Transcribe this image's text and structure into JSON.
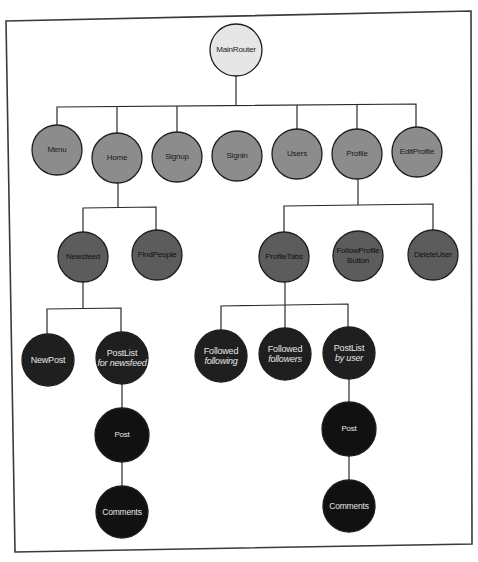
{
  "diagram": {
    "colors": {
      "level0": "#e6e6e6",
      "level1": "#8c8c8c",
      "level2": "#5c5c5c",
      "level3": "#1f1f1f",
      "stroke": "#2a2a2a",
      "frame": "#3a3a3a"
    },
    "nodes": {
      "main_router": {
        "label": "MainRouter"
      },
      "menu": {
        "label": "Menu"
      },
      "home": {
        "label": "Home"
      },
      "signup": {
        "label": "Signup"
      },
      "signin": {
        "label": "Signin"
      },
      "users": {
        "label": "Users"
      },
      "profile": {
        "label": "Profile"
      },
      "edit_profile": {
        "label": "EditProfile"
      },
      "newsfeed": {
        "label": "Newsfeed"
      },
      "find_people": {
        "label": "FindPeople"
      },
      "profile_tabs": {
        "label": "ProfileTabs"
      },
      "follow_profile_button": {
        "label": "FollowProfile",
        "sub": "Button"
      },
      "delete_user": {
        "label": "DeleteUser"
      },
      "new_post": {
        "label": "NewPost"
      },
      "postlist_newsfeed": {
        "label": "PostList",
        "sub": "for newsfeed"
      },
      "followed_following": {
        "label": "Followed",
        "sub": "following"
      },
      "followed_followers": {
        "label": "Followed",
        "sub": "followers"
      },
      "postlist_user": {
        "label": "PostList",
        "sub": "by user"
      },
      "post_a": {
        "label": "Post"
      },
      "comments_a": {
        "label": "Comments"
      },
      "post_b": {
        "label": "Post"
      },
      "comments_b": {
        "label": "Comments"
      }
    }
  }
}
